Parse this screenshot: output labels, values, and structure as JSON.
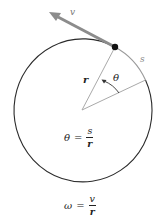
{
  "diagram": {
    "labels": {
      "velocity": "v",
      "arc_length": "s",
      "radius": "r",
      "angle": "θ"
    },
    "formulas": [
      {
        "lhs": "θ",
        "eq": "=",
        "numerator": "s",
        "denominator": "r"
      },
      {
        "lhs": "ω",
        "eq": "=",
        "numerator": "v",
        "denominator": "r"
      }
    ],
    "colors": {
      "circle": "#2b2b2b",
      "arc_segment": "#9a9a9a",
      "radius_lines": "#a9a9a9",
      "velocity_arrow": "#8c8c8c",
      "particle": "#111111",
      "text": "#222222",
      "label_gray": "#888888"
    }
  }
}
